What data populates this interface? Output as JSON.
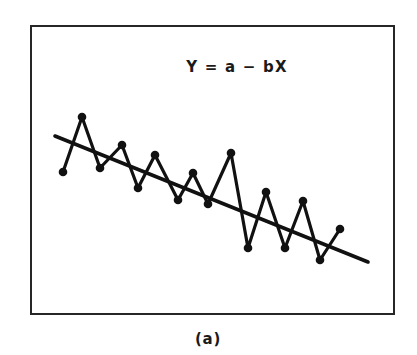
{
  "figure": {
    "caption": "(a)",
    "annotation": "Y = a − bX",
    "frame_color": "#262626",
    "series_color": "#111111",
    "trend_color": "#111111",
    "background_color": "#ffffff"
  },
  "chart_data": {
    "type": "line",
    "title": "",
    "subtitle": "",
    "xlabel": "",
    "ylabel": "",
    "annotations": [
      "Y = a − bX"
    ],
    "caption": "(a)",
    "grid": false,
    "legend": "none",
    "axis_ticks": false,
    "xlim": [
      0,
      20
    ],
    "ylim": [
      0,
      10
    ],
    "series": [
      {
        "name": "observed",
        "marker": "filled-circle",
        "x": [
          0,
          1,
          2,
          3,
          4,
          5,
          6,
          7,
          8,
          9,
          10,
          11,
          12,
          13,
          14,
          15,
          16,
          17,
          18
        ],
        "y": [
          6.02,
          8.93,
          6.09,
          7.46,
          4.95,
          6.49,
          3.92,
          5.46,
          3.77,
          7.14,
          1.84,
          4.99,
          1.86,
          4.71,
          1.54,
          3.41,
          6.0,
          6.0,
          6.0
        ],
        "pixel_points": [
          [
            63,
            172
          ],
          [
            82,
            117
          ],
          [
            100,
            168
          ],
          [
            122,
            145
          ],
          [
            138,
            188
          ],
          [
            155,
            155
          ],
          [
            178,
            200
          ],
          [
            193,
            173
          ],
          [
            208,
            204
          ],
          [
            231,
            153
          ],
          [
            248,
            248
          ],
          [
            266,
            192
          ],
          [
            285,
            248
          ],
          [
            303,
            201
          ],
          [
            320,
            260
          ],
          [
            340,
            229
          ]
        ]
      },
      {
        "name": "trend",
        "marker": "none",
        "type": "line",
        "equation": "Y = a - bX",
        "endpoints_pixel": [
          [
            55,
            136
          ],
          [
            368,
            262
          ]
        ],
        "x": [
          0,
          18
        ],
        "y": [
          7.3,
          2.6
        ]
      }
    ]
  },
  "frame": {
    "x": 30,
    "y": 25,
    "width": 365,
    "height": 290,
    "stroke_width": 2
  },
  "annotation_position": {
    "x": 237,
    "y": 72
  },
  "caption_position": {
    "x": 208,
    "y": 344
  }
}
